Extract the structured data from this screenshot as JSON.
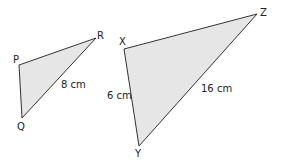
{
  "triangles": [
    {
      "name": "PQR",
      "vertices": {
        "P": [
          19,
          65
        ],
        "Q": [
          22,
          118
        ],
        "R": [
          96,
          38
        ]
      },
      "labels": {
        "P": "P",
        "Q": "Q",
        "R": "R"
      },
      "side_labels": {
        "QR": "8 cm"
      }
    },
    {
      "name": "XYZ",
      "vertices": {
        "X": [
          124,
          49
        ],
        "Y": [
          139,
          146
        ],
        "Z": [
          257,
          14
        ]
      },
      "labels": {
        "X": "X",
        "Y": "Y",
        "Z": "Z"
      },
      "side_labels": {
        "XY": "6 cm",
        "YZ": "16 cm"
      }
    }
  ],
  "colors": {
    "fill": "#e6e6e6",
    "stroke": "#333333",
    "text": "#222222"
  }
}
